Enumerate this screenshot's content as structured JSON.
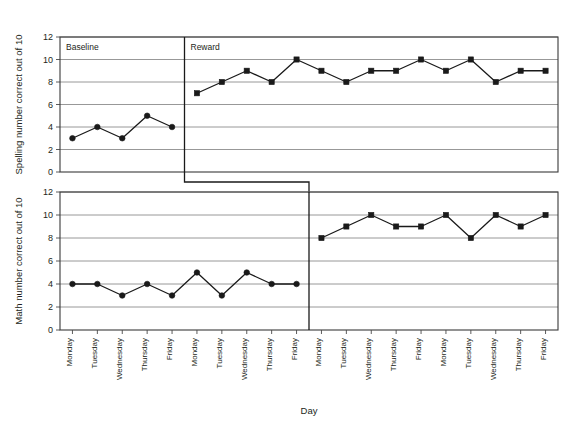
{
  "chart_data": {
    "type": "line",
    "title": "",
    "xlabel": "Day",
    "grid": true,
    "legend_position": "none",
    "ylim": [
      0,
      12
    ],
    "ytick_values": [
      0,
      2,
      4,
      6,
      8,
      10,
      12
    ],
    "categories": [
      "Monday",
      "Tuesday",
      "Wednesday",
      "Thursday",
      "Friday",
      "Monday",
      "Tuesday",
      "Wednesday",
      "Thursday",
      "Friday",
      "Monday",
      "Tuesday",
      "Wednesday",
      "Thursday",
      "Friday",
      "Monday",
      "Tuesday",
      "Wednesday",
      "Thursday",
      "Friday"
    ],
    "panels": [
      {
        "id": "spelling",
        "ylabel": "Spelling number correct out of 10",
        "phase_change_after_index": 4,
        "phases": [
          {
            "name": "Baseline",
            "label": "Baseline",
            "marker": "circle",
            "start_index": 0,
            "values": [
              3,
              4,
              3,
              5,
              4
            ]
          },
          {
            "name": "Reward",
            "label": "Reward",
            "marker": "square",
            "start_index": 5,
            "values": [
              7,
              8,
              9,
              8,
              10,
              9,
              8,
              9,
              9,
              10,
              9,
              10,
              8,
              9,
              9
            ]
          }
        ]
      },
      {
        "id": "math",
        "ylabel": "Math number correct out of 10",
        "phase_change_after_index": 9,
        "phases": [
          {
            "name": "Baseline",
            "label": "",
            "marker": "circle",
            "start_index": 0,
            "values": [
              4,
              4,
              3,
              4,
              3,
              5,
              3,
              5,
              4,
              4
            ]
          },
          {
            "name": "Reward",
            "label": "",
            "marker": "square",
            "start_index": 10,
            "values": [
              8,
              9,
              10,
              9,
              9,
              10,
              8,
              10,
              9,
              10
            ]
          }
        ]
      }
    ]
  },
  "colors": {
    "line": "#1a1a1a",
    "grid": "#8c8c8c",
    "frame": "#3a3a3a",
    "text": "#231f20",
    "background": "#ffffff"
  }
}
